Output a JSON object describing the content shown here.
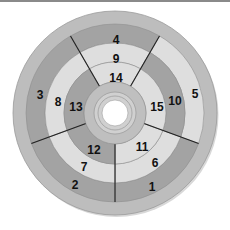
{
  "diagram": {
    "type": "concentric-segmented-disc",
    "center": [
      115,
      113
    ],
    "colors": {
      "outer_ring": "#bdbdbd",
      "dark": "#a3a3a3",
      "light": "#dedede",
      "hub_ring": "#bfbfbf",
      "hub_inner": "#d0d0d0",
      "hole": "#ffffff",
      "divider": "#222222"
    },
    "rings": [
      {
        "name": "outer-segment-ring",
        "r_outer": 89,
        "r_inner": 70,
        "segments": [
          {
            "label": "1",
            "start": 270,
            "end": 340,
            "shade": "dark",
            "label_pos": [
              152,
              187
            ]
          },
          {
            "label": "2",
            "start": 200,
            "end": 270,
            "shade": "dark",
            "label_pos": [
              75,
              185
            ]
          },
          {
            "label": "3",
            "start": 120,
            "end": 200,
            "shade": "dark",
            "label_pos": [
              40,
              95
            ]
          },
          {
            "label": "4",
            "start": 60,
            "end": 120,
            "shade": "dark",
            "label_pos": [
              116,
              40
            ]
          },
          {
            "label": "5",
            "start": -20,
            "end": 60,
            "shade": "light",
            "label_pos": [
              195,
              94
            ]
          }
        ]
      },
      {
        "name": "middle-segment-ring",
        "r_outer": 70,
        "r_inner": 51,
        "segments": [
          {
            "label": "6",
            "start": 270,
            "end": 340,
            "shade": "light",
            "label_pos": [
              155,
              163
            ]
          },
          {
            "label": "7",
            "start": 200,
            "end": 270,
            "shade": "light",
            "label_pos": [
              84,
              167
            ]
          },
          {
            "label": "8",
            "start": 120,
            "end": 200,
            "shade": "light",
            "label_pos": [
              58,
              102
            ]
          },
          {
            "label": "9",
            "start": 60,
            "end": 120,
            "shade": "light",
            "label_pos": [
              116,
              59
            ]
          },
          {
            "label": "10",
            "start": -20,
            "end": 60,
            "shade": "dark",
            "label_pos": [
              175,
              101
            ]
          }
        ]
      },
      {
        "name": "inner-segment-ring",
        "r_outer": 51,
        "r_inner": 31,
        "segments": [
          {
            "label": "11",
            "start": 270,
            "end": 340,
            "shade": "light",
            "label_pos": [
              142,
              147
            ]
          },
          {
            "label": "12",
            "start": 200,
            "end": 270,
            "shade": "dark",
            "label_pos": [
              94,
              150
            ]
          },
          {
            "label": "13",
            "start": 120,
            "end": 200,
            "shade": "dark",
            "label_pos": [
              76,
              107
            ]
          },
          {
            "label": "14",
            "start": 60,
            "end": 120,
            "shade": "light",
            "label_pos": [
              116,
              78
            ]
          },
          {
            "label": "15",
            "start": -20,
            "end": 60,
            "shade": "light",
            "label_pos": [
              157,
              107
            ]
          }
        ]
      }
    ],
    "outer_ring": {
      "r_outer": 102,
      "r_inner": 89
    },
    "hub": {
      "r_outer": 31,
      "r_mid": 21,
      "r_inner": 17,
      "r_hole": 13
    },
    "dividers_deg": [
      270,
      340,
      200,
      120,
      60
    ]
  }
}
